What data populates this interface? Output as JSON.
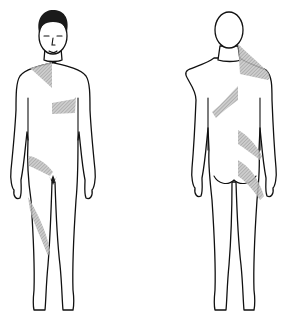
{
  "diagram": {
    "type": "body-chart",
    "views": [
      {
        "id": "front",
        "label": "Anterior view",
        "shaded_regions": [
          "right-shoulder-upper-chest",
          "left-lower-chest",
          "right-inguinal",
          "right-anterior-thigh"
        ]
      },
      {
        "id": "back",
        "label": "Posterior view",
        "shaded_regions": [
          "left-upper-back-neck",
          "mid-back-band",
          "lower-back-band",
          "left-buttock-hip"
        ]
      }
    ],
    "colors": {
      "outline": "#111111",
      "hatch": "#9a9a9a",
      "background": "#ffffff"
    }
  }
}
